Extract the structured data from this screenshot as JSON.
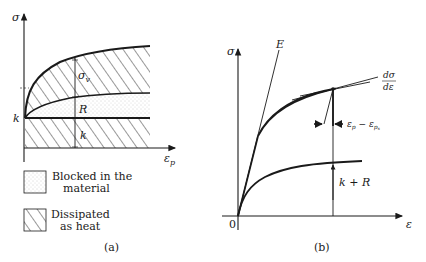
{
  "panel_a": {
    "caption": "(a)",
    "y_axis_label": "σ",
    "x_axis_label": "ε",
    "x_axis_subscript": "p",
    "k_axis_label": "k",
    "dimension_labels": {
      "sigma_v": "σ",
      "sigma_v_sub": "v",
      "R": "R",
      "k": "k"
    },
    "legend": [
      {
        "pattern": "dotted",
        "line1": "Blocked in the",
        "line2": "material"
      },
      {
        "pattern": "hatched",
        "line1": "Dissipated",
        "line2": "as heat"
      }
    ]
  },
  "panel_b": {
    "caption": "(b)",
    "y_axis_label": "σ",
    "x_axis_label": "ε",
    "origin_label": "0",
    "elastic_line_label": "E",
    "tangent_label_num": "dσ",
    "tangent_label_den": "dε",
    "plastic_offset_label": "ε",
    "plastic_offset_sub1": "p",
    "plastic_offset_minus": " − ε",
    "plastic_offset_sub2": "p",
    "plastic_offset_sub2b": "s",
    "threshold_label": "k + R"
  },
  "colors": {
    "ink": "#1a1a1a",
    "background": "#ffffff",
    "stipple": "#b8b8b8"
  }
}
